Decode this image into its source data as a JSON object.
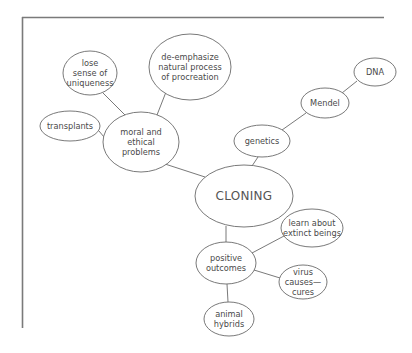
{
  "diagram": {
    "type": "concept-map",
    "frame": {
      "color": "#7a7a7a"
    },
    "central_node": {
      "id": "cloning",
      "label": "CLONING"
    },
    "nodes": [
      {
        "id": "cloning",
        "label": "CLONING",
        "cx": 244,
        "cy": 196,
        "rx": 49,
        "ry": 31
      },
      {
        "id": "moral",
        "label": "moral and\nethical\nproblems",
        "cx": 141,
        "cy": 142,
        "rx": 38,
        "ry": 30
      },
      {
        "id": "uniqueness",
        "label": "lose\nsense of\nuniqueness",
        "cx": 90,
        "cy": 73,
        "rx": 27,
        "ry": 22
      },
      {
        "id": "procreation",
        "label": "de-emphasize\nnatural process\nof procreation",
        "cx": 190,
        "cy": 67,
        "rx": 41,
        "ry": 33
      },
      {
        "id": "transplants",
        "label": "transplants",
        "cx": 70,
        "cy": 126,
        "rx": 30,
        "ry": 15
      },
      {
        "id": "genetics",
        "label": "genetics",
        "cx": 262,
        "cy": 141,
        "rx": 28,
        "ry": 16
      },
      {
        "id": "mendel",
        "label": "Mendel",
        "cx": 325,
        "cy": 103,
        "rx": 24,
        "ry": 15
      },
      {
        "id": "dna",
        "label": "DNA",
        "cx": 375,
        "cy": 72,
        "rx": 21,
        "ry": 14
      },
      {
        "id": "positive",
        "label": "positive\noutcomes",
        "cx": 226,
        "cy": 263,
        "rx": 30,
        "ry": 21
      },
      {
        "id": "extinct",
        "label": "learn about\nextinct beings",
        "cx": 312,
        "cy": 228,
        "rx": 31,
        "ry": 19
      },
      {
        "id": "virus",
        "label": "virus\ncauses—\ncures",
        "cx": 303,
        "cy": 282,
        "rx": 24,
        "ry": 17
      },
      {
        "id": "hybrids",
        "label": "animal\nhybrids",
        "cx": 229,
        "cy": 319,
        "rx": 25,
        "ry": 17
      }
    ],
    "edges": [
      {
        "from": "cloning",
        "to": "moral",
        "x1": 205,
        "y1": 177,
        "x2": 165,
        "y2": 164
      },
      {
        "from": "moral",
        "to": "uniqueness",
        "x1": 125,
        "y1": 115,
        "x2": 103,
        "y2": 93
      },
      {
        "from": "moral",
        "to": "procreation",
        "x1": 157,
        "y1": 115,
        "x2": 166,
        "y2": 92
      },
      {
        "from": "moral",
        "to": "transplants",
        "x1": 104,
        "y1": 137,
        "x2": 99,
        "y2": 131
      },
      {
        "from": "cloning",
        "to": "genetics",
        "x1": 252,
        "y1": 166,
        "x2": 258,
        "y2": 157
      },
      {
        "from": "genetics",
        "to": "mendel",
        "x1": 282,
        "y1": 130,
        "x2": 306,
        "y2": 113
      },
      {
        "from": "mendel",
        "to": "dna",
        "x1": 342,
        "y1": 93,
        "x2": 357,
        "y2": 81
      },
      {
        "from": "cloning",
        "to": "positive",
        "x1": 226,
        "y1": 226,
        "x2": 226,
        "y2": 242
      },
      {
        "from": "positive",
        "to": "extinct",
        "x1": 252,
        "y1": 253,
        "x2": 284,
        "y2": 236
      },
      {
        "from": "positive",
        "to": "virus",
        "x1": 254,
        "y1": 270,
        "x2": 280,
        "y2": 278
      },
      {
        "from": "positive",
        "to": "hybrids",
        "x1": 227,
        "y1": 284,
        "x2": 228,
        "y2": 302
      }
    ]
  }
}
